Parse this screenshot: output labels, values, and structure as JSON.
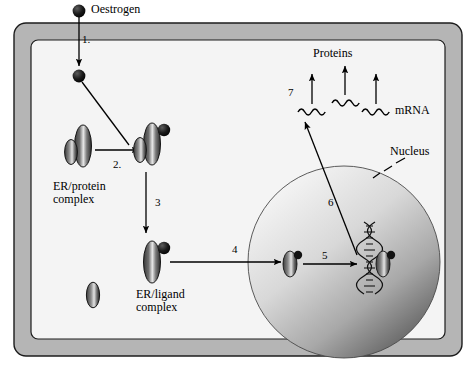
{
  "figure": {
    "title_text": "Oestrogen signalling pathway diagram",
    "background_color": "#ffffff",
    "membrane_color": "#b3b3b3",
    "cytoplasm_color": "#f2f2f2",
    "ink_color": "#000000",
    "nucleus_light": "#efefef",
    "nucleus_dark": "#5a5a5a"
  },
  "labels": {
    "oestrogen": "Oestrogen",
    "er_protein_complex": "ER/protein\ncomplex",
    "er_protein_complex_line1": "ER/protein",
    "er_protein_complex_line2": "complex",
    "er_ligand_complex_line1": "ER/ligand",
    "er_ligand_complex_line2": "complex",
    "proteins": "Proteins",
    "mrna": "mRNA",
    "nucleus": "Nucleus"
  },
  "steps": [
    {
      "id": "1",
      "label": "1.",
      "x": 82,
      "y": 33,
      "description": "Oestrogen crosses the cell membrane"
    },
    {
      "id": "2",
      "label": "2.",
      "x": 95,
      "y": 160,
      "description": "Oestrogen binds the ER/protein complex"
    },
    {
      "id": "3",
      "label": "3",
      "x": 155,
      "y": 200,
      "description": "Conversion to ER/ligand complex"
    },
    {
      "id": "4",
      "label": "4",
      "x": 233,
      "y": 245,
      "description": "ER/ligand complex travels to the nucleus"
    },
    {
      "id": "5",
      "label": "5",
      "x": 322,
      "y": 253,
      "description": "Complex moves toward DNA"
    },
    {
      "id": "6",
      "label": "6",
      "x": 330,
      "y": 200,
      "description": "Transcription output leaves the nucleus"
    },
    {
      "id": "7",
      "label": "7",
      "x": 290,
      "y": 91,
      "description": "mRNA translated into proteins"
    }
  ],
  "icons": {
    "oestrogen_dot": "filled-circle-icon",
    "receptor": "receptor-capsule-icon",
    "dna": "dna-helix-icon",
    "mrna_squiggle": "wavy-line-icon",
    "arrow": "arrow-icon",
    "dashed_pointer": "dashed-leader-icon"
  },
  "mrna_strands": [
    {
      "x": 312,
      "y": 110
    },
    {
      "x": 345,
      "y": 101
    },
    {
      "x": 375,
      "y": 110
    }
  ],
  "protein_arrows": [
    {
      "x": 312,
      "y_top": 78,
      "y_bottom": 104
    },
    {
      "x": 345,
      "y_top": 70,
      "y_bottom": 95
    },
    {
      "x": 375,
      "y_top": 78,
      "y_bottom": 104
    }
  ]
}
